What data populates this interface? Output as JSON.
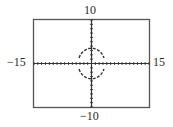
{
  "window": {
    "xmin": "−15",
    "xmax": "15",
    "ymin": "−10",
    "ymax": "10"
  },
  "chart_data": {
    "type": "line",
    "title": "",
    "xlabel": "",
    "ylabel": "",
    "xlim": [
      -15,
      15
    ],
    "ylim": [
      -10,
      10
    ],
    "grid": false,
    "axis_ticks": {
      "x_step": 1,
      "y_step": 1
    },
    "series": [
      {
        "name": "upper semicircle",
        "equation": "y = sqrt(12.25 - x^2)",
        "center": [
          0,
          0
        ],
        "radius": 3.5
      },
      {
        "name": "lower semicircle",
        "equation": "y = -sqrt(12.25 - x^2)",
        "center": [
          0,
          0
        ],
        "radius": 3.5
      }
    ],
    "tick_labels": {
      "left": "−15",
      "right": "15",
      "top": "10",
      "bottom": "−10"
    }
  },
  "colors": {
    "frame": "#555555",
    "axis": "#333333",
    "curve": "#333333"
  }
}
